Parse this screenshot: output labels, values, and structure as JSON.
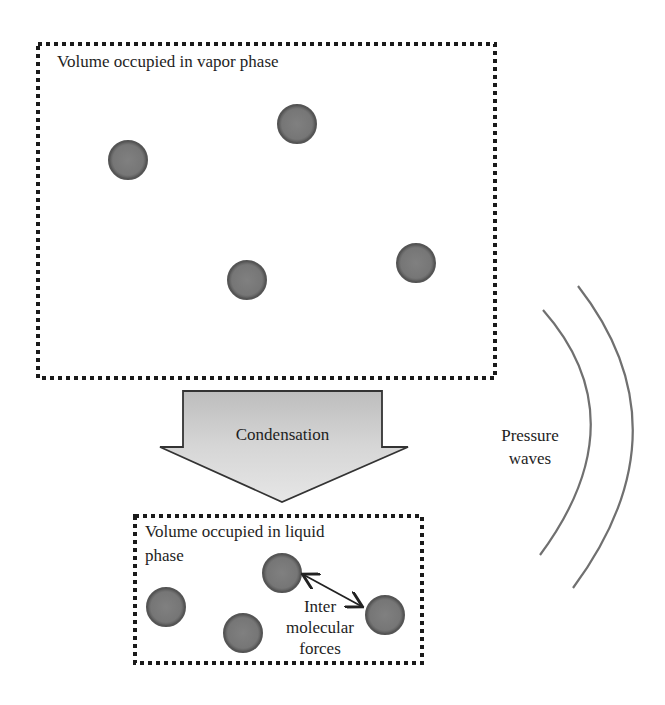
{
  "diagram": {
    "vapor_box": {
      "label": "Volume occupied in vapor phase",
      "rect": {
        "x": 38,
        "y": 44,
        "w": 457,
        "h": 334
      },
      "molecules": [
        {
          "cx": 128,
          "cy": 160
        },
        {
          "cx": 297,
          "cy": 124
        },
        {
          "cx": 247,
          "cy": 280
        },
        {
          "cx": 416,
          "cy": 263
        }
      ]
    },
    "process_arrow": {
      "label": "Condensation",
      "fill": "#cfcfcf"
    },
    "liquid_box": {
      "label_line1": "Volume occupied in liquid",
      "label_line2": "phase",
      "rect": {
        "x": 135,
        "y": 516,
        "w": 287,
        "h": 147
      },
      "molecules": [
        {
          "cx": 166,
          "cy": 607
        },
        {
          "cx": 243,
          "cy": 633
        },
        {
          "cx": 282,
          "cy": 573
        },
        {
          "cx": 385,
          "cy": 615
        }
      ],
      "force_label_line1": "Inter",
      "force_label_line2": "molecular",
      "force_label_line3": "forces"
    },
    "pressure_waves": {
      "label_line1": "Pressure",
      "label_line2": "waves",
      "color": "#707070"
    },
    "colors": {
      "molecule_fill": "#7a7a7a",
      "molecule_stroke": "#555555",
      "dotted_border": "#1a1a1a"
    }
  }
}
